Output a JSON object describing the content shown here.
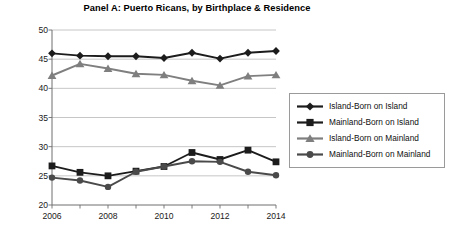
{
  "chart_data": {
    "type": "line",
    "title": "Panel A: Puerto Ricans, by Birthplace & Residence",
    "xlabel": "",
    "ylabel": "Poverty Rate (%)",
    "x": [
      2006,
      2007,
      2008,
      2009,
      2010,
      2011,
      2012,
      2013,
      2014
    ],
    "x_tick_labels": [
      "2006",
      "",
      "2008",
      "",
      "2010",
      "",
      "2012",
      "",
      "2014"
    ],
    "xlim": [
      2006,
      2014
    ],
    "ylim": [
      20,
      50
    ],
    "y_ticks": [
      20,
      25,
      30,
      35,
      40,
      45,
      50
    ],
    "y_tick_labels": [
      "20",
      "25",
      "30",
      "35",
      "40",
      "45",
      "50"
    ],
    "grid": "horizontal",
    "legend_position": "right-outside",
    "series": [
      {
        "name": "Island-Born on Island",
        "marker": "diamond",
        "color": "#1c1c1c",
        "values": [
          46.0,
          45.6,
          45.5,
          45.5,
          45.2,
          46.1,
          45.1,
          46.1,
          46.4
        ]
      },
      {
        "name": "Mainland-Born on Island",
        "marker": "square",
        "color": "#1c1c1c",
        "values": [
          26.7,
          25.6,
          25.0,
          25.8,
          26.6,
          29.0,
          27.8,
          29.4,
          27.4
        ]
      },
      {
        "name": "Island-Born on Mainland",
        "marker": "triangle",
        "color": "#7f7f7f",
        "values": [
          42.2,
          44.2,
          43.4,
          42.5,
          42.3,
          41.3,
          40.5,
          42.1,
          42.3
        ]
      },
      {
        "name": "Mainland-Born on Mainland",
        "marker": "circle",
        "color": "#4a4a4a",
        "values": [
          24.7,
          24.2,
          23.1,
          25.7,
          26.6,
          27.5,
          27.4,
          25.7,
          25.1
        ]
      }
    ]
  },
  "legend": {
    "items": [
      {
        "label": "Island-Born on Island",
        "marker": "diamond",
        "color": "#1c1c1c"
      },
      {
        "label": "Mainland-Born on Island",
        "marker": "square",
        "color": "#1c1c1c"
      },
      {
        "label": "Island-Born on Mainland",
        "marker": "triangle",
        "color": "#7f7f7f"
      },
      {
        "label": "Mainland-Born on Mainland",
        "marker": "circle",
        "color": "#4a4a4a"
      }
    ]
  },
  "axes": {
    "grid_color": "#b7b7b7",
    "axis_color": "#6e6e6e"
  }
}
